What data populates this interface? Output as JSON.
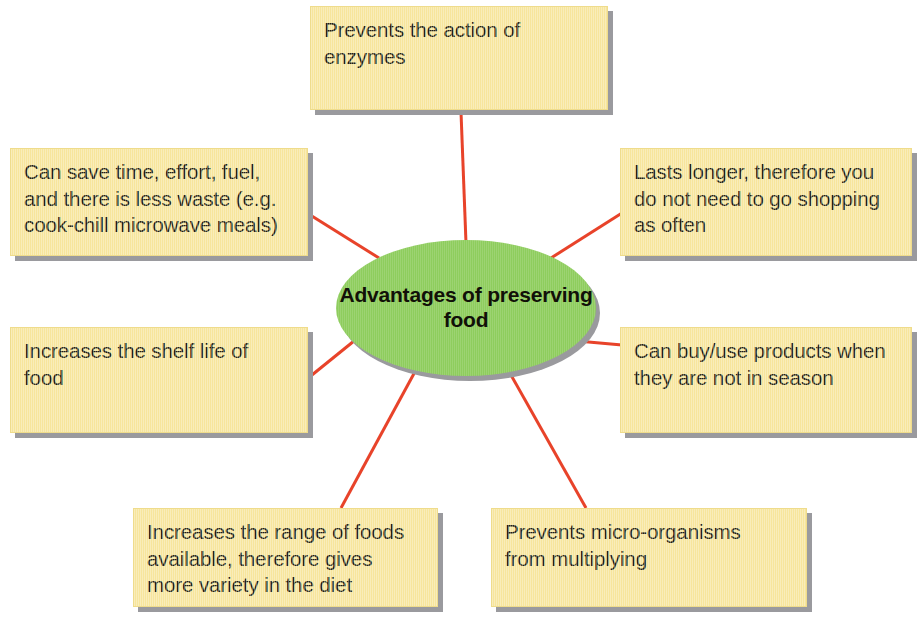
{
  "diagram": {
    "type": "spider-map",
    "center": {
      "label": "Advantages of\npreserving food",
      "line1": "Advantages of",
      "line2": "preserving food",
      "fill_color": "#8ecd5d",
      "shadow_color": "#9a9a9e"
    },
    "style": {
      "box_fill_color": "#f7e59c",
      "box_shadow_color": "#9a9a9e",
      "connector_color": "#e8432a",
      "text_color": "#231f12",
      "background_color": "#ffffff"
    },
    "nodes": [
      {
        "id": "top",
        "position": "top",
        "lines": [
          "Prevents the action of",
          "enzymes"
        ],
        "text": "Prevents the action of enzymes"
      },
      {
        "id": "top-left",
        "position": "top-left",
        "lines": [
          "Can save time, effort, fuel,",
          "and there is less waste (e.g.",
          "cook-chill microwave meals)"
        ],
        "text": "Can save time, effort, fuel, and there is less waste (e.g. cook-chill microwave meals)"
      },
      {
        "id": "top-right",
        "position": "top-right",
        "lines": [
          "Lasts longer, therefore you",
          "do not need to go shopping",
          "as often"
        ],
        "text": "Lasts longer, therefore you do not need to go shopping as often"
      },
      {
        "id": "mid-left",
        "position": "middle-left",
        "lines": [
          "Increases the shelf life of",
          "food"
        ],
        "text": "Increases the shelf life of food"
      },
      {
        "id": "mid-right",
        "position": "middle-right",
        "lines": [
          "Can buy/use products when",
          "they are not in season"
        ],
        "text": "Can buy/use products when they are not in season"
      },
      {
        "id": "bottom-left",
        "position": "bottom-left",
        "lines": [
          "Increases the range of foods",
          "available, therefore gives",
          "more variety in the diet"
        ],
        "text": "Increases the range of foods available, therefore gives more variety in the diet"
      },
      {
        "id": "bottom-right",
        "position": "bottom-right",
        "lines": [
          "Prevents micro-organisms",
          "from multiplying"
        ],
        "text": "Prevents micro-organisms from multiplying"
      }
    ],
    "connector_count": 7
  }
}
